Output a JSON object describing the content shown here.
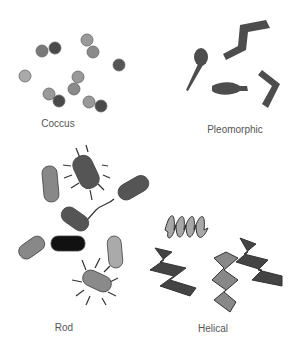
{
  "groups": [
    {
      "id": "coccus",
      "label": "Coccus"
    },
    {
      "id": "pleomorphic",
      "label": "Pleomorphic"
    },
    {
      "id": "rod",
      "label": "Rod"
    },
    {
      "id": "helical",
      "label": "Helical"
    }
  ],
  "colors": {
    "dark": "#4a4a4a",
    "mid": "#7a7a7a",
    "light": "#a8a8a8",
    "black": "#111111",
    "label": "#555555"
  }
}
